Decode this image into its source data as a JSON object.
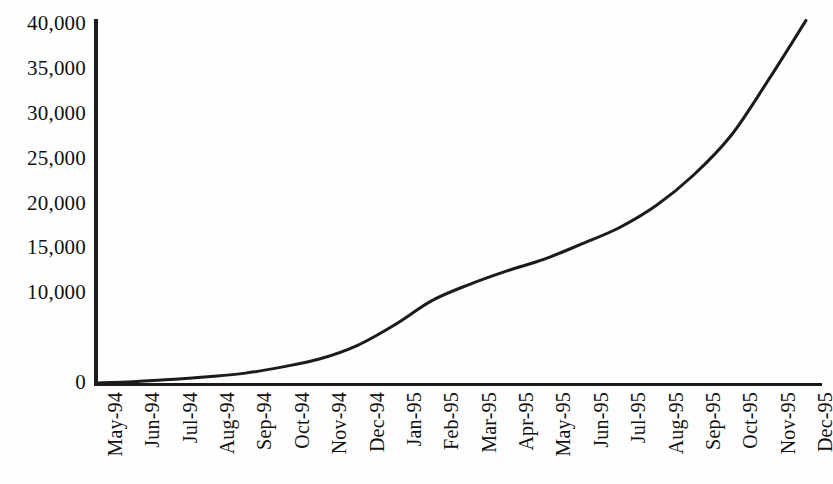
{
  "chart_data": {
    "type": "line",
    "title": "",
    "subtitle": "",
    "xlabel": "",
    "ylabel": "",
    "grid": false,
    "legend": "none",
    "xlim_categories": 20,
    "ylim": [
      0,
      40000
    ],
    "y_tick_values": [
      40000,
      35000,
      30000,
      25000,
      20000,
      15000,
      10000,
      5000,
      0
    ],
    "y_tick_labels": [
      "40,000",
      "35,000",
      "30,000",
      "25,000",
      "20,000",
      "15,000",
      "10,000",
      "",
      "0"
    ],
    "categories": [
      "May-94",
      "Jun-94",
      "Jul-94",
      "Aug-94",
      "Sep-94",
      "Oct-94",
      "Nov-94",
      "Dec-94",
      "Jan-95",
      "Feb-95",
      "Mar-95",
      "Apr-95",
      "May-95",
      "Jun-95",
      "Jul-95",
      "Aug-95",
      "Sep-95",
      "Oct-95",
      "Nov-95",
      "Dec-95"
    ],
    "series": [
      {
        "name": "cumulative-total",
        "color": "#1b1b1b",
        "line_width": 3,
        "values": [
          0,
          150,
          400,
          700,
          1100,
          1800,
          2700,
          4200,
          6500,
          9200,
          11000,
          12500,
          13800,
          15500,
          17300,
          19800,
          23200,
          27600,
          33800,
          40400
        ]
      }
    ]
  },
  "axes": {
    "y_axis_name": "value-axis",
    "x_axis_name": "month-axis"
  }
}
